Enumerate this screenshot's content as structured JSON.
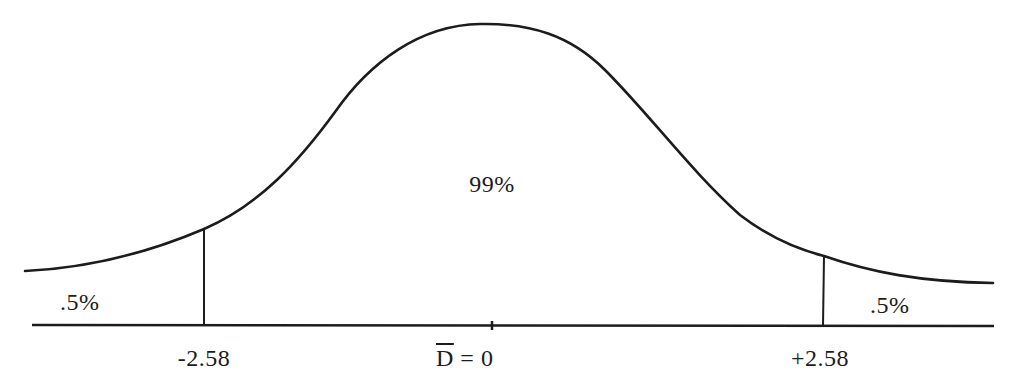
{
  "figure": {
    "type": "normal-distribution-diagram",
    "center_label": "99%",
    "left_tail_label": ".5%",
    "right_tail_label": ".5%",
    "axis_labels": {
      "left_critical": "-2.58",
      "mean_symbol": "D",
      "mean_equals": "= 0",
      "right_critical": "+2.58"
    },
    "colors": {
      "line": "#1c1c1c",
      "background": "#ffffff"
    }
  }
}
